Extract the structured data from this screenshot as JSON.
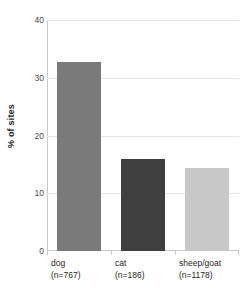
{
  "chart_data": {
    "type": "bar",
    "title": "",
    "subtitle": "",
    "xlabel": "",
    "ylabel": "% of sites",
    "categories": [
      "dog",
      "cat",
      "sheep/goat"
    ],
    "category_sublabels": [
      "(n=767)",
      "(n=186)",
      "(n=1178)"
    ],
    "counts": [
      767,
      186,
      1178
    ],
    "values": [
      32.7,
      16.0,
      14.4
    ],
    "series": [
      {
        "name": "% of sites",
        "values": [
          32.7,
          16.0,
          14.4
        ]
      }
    ],
    "ylim": [
      0,
      40
    ],
    "yticks": [
      0,
      10,
      20,
      30,
      40
    ],
    "ytick_labels": [
      "0",
      "10",
      "20",
      "30",
      "40"
    ],
    "grid": "horizontal",
    "legend": "none",
    "bar_colors": [
      "#7a7a7a",
      "#3f3f3f",
      "#c8c8c8"
    ],
    "axis_color": "#c9c9c9",
    "gridline_color": "#e6e6e6",
    "tick_label_color": "#4a4a4a",
    "axis_title_color": "#1d1d1d",
    "background": "#ffffff"
  }
}
